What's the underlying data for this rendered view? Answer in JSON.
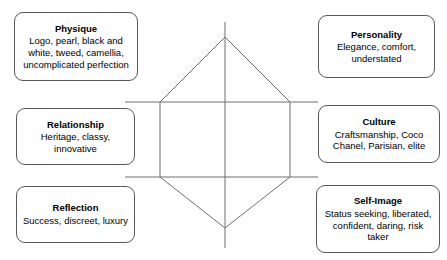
{
  "diagram": {
    "type": "brand-identity-prism",
    "shape": "hexagon",
    "facets": [
      {
        "id": "physique",
        "title": "Physique",
        "body": "Logo, pearl, black and white, tweed, camellia, uncomplicated perfection",
        "position": "top-left"
      },
      {
        "id": "personality",
        "title": "Personality",
        "body": "Elegance, comfort, understated",
        "position": "top-right"
      },
      {
        "id": "relationship",
        "title": "Relationship",
        "body": "Heritage, classy, innovative",
        "position": "middle-left"
      },
      {
        "id": "culture",
        "title": "Culture",
        "body": "Craftsmanship, Coco Chanel, Parisian, elite",
        "position": "middle-right"
      },
      {
        "id": "reflection",
        "title": "Reflection",
        "body": "Success, discreet, luxury",
        "position": "bottom-left"
      },
      {
        "id": "self_image",
        "title": "Self-Image",
        "body": "Status seeking, liberated, confident, daring, risk taker",
        "position": "bottom-right"
      }
    ],
    "colors": {
      "background": "#ffffff",
      "box_border": "#55585c",
      "line": "#6b6e72",
      "text": "#000000"
    }
  }
}
